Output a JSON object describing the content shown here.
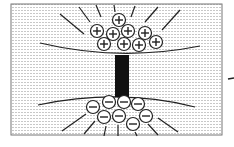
{
  "diagram": {
    "positive_symbol": "+",
    "negative_symbol": "−",
    "positive_charges": [
      {
        "cx": 119,
        "cy": 20
      },
      {
        "cx": 97,
        "cy": 31
      },
      {
        "cx": 113,
        "cy": 34
      },
      {
        "cx": 128,
        "cy": 31
      },
      {
        "cx": 145,
        "cy": 33
      },
      {
        "cx": 156,
        "cy": 42
      },
      {
        "cx": 104,
        "cy": 44
      },
      {
        "cx": 124,
        "cy": 44
      },
      {
        "cx": 139,
        "cy": 45
      }
    ],
    "negative_charges": [
      {
        "cx": 93,
        "cy": 107
      },
      {
        "cx": 109,
        "cy": 102
      },
      {
        "cx": 124,
        "cy": 102
      },
      {
        "cx": 138,
        "cy": 104
      },
      {
        "cx": 104,
        "cy": 117
      },
      {
        "cx": 119,
        "cy": 116
      },
      {
        "cx": 146,
        "cy": 116
      },
      {
        "cx": 133,
        "cy": 124
      }
    ],
    "colors": {
      "stroke": "#222222",
      "background_hatch": "#c8c8c8",
      "bar": "#111111",
      "frame": "#555555"
    }
  }
}
